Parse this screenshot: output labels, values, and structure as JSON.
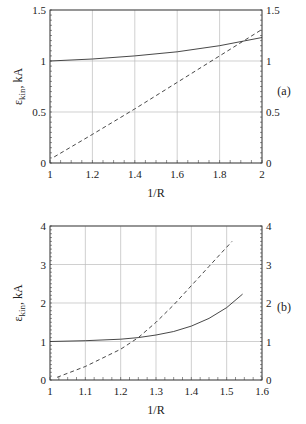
{
  "chart_data": [
    {
      "type": "line",
      "panel_label": "(a)",
      "xlabel": "1/R",
      "ylabel": "ε_kin, kA",
      "xlim": [
        1,
        2
      ],
      "ylim": [
        0,
        1.5
      ],
      "x_ticks": [
        "1",
        "1.2",
        "1.4",
        "1.6",
        "1.8",
        "2"
      ],
      "y_ticks": [
        "0",
        "0.5",
        "1",
        "1.5"
      ],
      "grid": true,
      "series": [
        {
          "name": "solid",
          "style": "solid",
          "x": [
            1.0,
            1.2,
            1.4,
            1.6,
            1.8,
            2.0
          ],
          "values": [
            1.0,
            1.02,
            1.05,
            1.09,
            1.15,
            1.23
          ]
        },
        {
          "name": "dashed",
          "style": "dashed",
          "x": [
            1.02,
            1.2,
            1.4,
            1.6,
            1.8,
            2.0
          ],
          "values": [
            0.06,
            0.28,
            0.53,
            0.79,
            1.05,
            1.31
          ]
        }
      ]
    },
    {
      "type": "line",
      "panel_label": "(b)",
      "xlabel": "1/R",
      "ylabel": "ε_kin, kA",
      "xlim": [
        1,
        1.6
      ],
      "ylim": [
        0,
        4
      ],
      "x_ticks": [
        "1",
        "1.1",
        "1.2",
        "1.3",
        "1.4",
        "1.5",
        "1.6"
      ],
      "y_ticks": [
        "0",
        "1",
        "2",
        "3",
        "4"
      ],
      "grid": true,
      "series": [
        {
          "name": "solid",
          "style": "solid",
          "x": [
            1.0,
            1.1,
            1.2,
            1.25,
            1.3,
            1.35,
            1.4,
            1.45,
            1.5,
            1.545
          ],
          "values": [
            1.0,
            1.02,
            1.06,
            1.1,
            1.17,
            1.26,
            1.4,
            1.6,
            1.88,
            2.23
          ]
        },
        {
          "name": "dashed",
          "style": "dashed",
          "x": [
            1.02,
            1.1,
            1.2,
            1.25,
            1.3,
            1.35,
            1.4,
            1.45,
            1.515
          ],
          "values": [
            0.07,
            0.35,
            0.8,
            1.1,
            1.5,
            1.95,
            2.45,
            2.95,
            3.6
          ]
        }
      ]
    }
  ]
}
